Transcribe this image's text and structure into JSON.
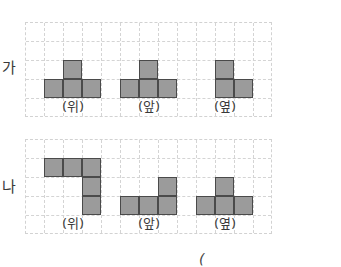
{
  "diagram": {
    "cell_size": 19,
    "grid_cols": 13,
    "grid_rows": 5,
    "colors": {
      "fill": "#9b9b9b",
      "border": "#4a4a4a",
      "grid": "#d4d4d4"
    },
    "rows": [
      {
        "label": "가",
        "views": [
          {
            "label": "(위)",
            "cells": [
              [
                2,
                2
              ],
              [
                1,
                3
              ],
              [
                2,
                3
              ],
              [
                3,
                3
              ]
            ]
          },
          {
            "label": "(앞)",
            "cells": [
              [
                6,
                2
              ],
              [
                5,
                3
              ],
              [
                6,
                3
              ],
              [
                7,
                3
              ]
            ]
          },
          {
            "label": "(옆)",
            "cells": [
              [
                10,
                2
              ],
              [
                10,
                3
              ],
              [
                11,
                3
              ]
            ]
          }
        ]
      },
      {
        "label": "나",
        "views": [
          {
            "label": "(위)",
            "cells": [
              [
                1,
                1
              ],
              [
                2,
                1
              ],
              [
                3,
                1
              ],
              [
                3,
                2
              ],
              [
                3,
                3
              ]
            ]
          },
          {
            "label": "(앞)",
            "cells": [
              [
                7,
                2
              ],
              [
                5,
                3
              ],
              [
                6,
                3
              ],
              [
                7,
                3
              ]
            ]
          },
          {
            "label": "(옆)",
            "cells": [
              [
                10,
                2
              ],
              [
                9,
                3
              ],
              [
                10,
                3
              ],
              [
                11,
                3
              ]
            ]
          }
        ]
      }
    ],
    "footer_partial": "("
  }
}
